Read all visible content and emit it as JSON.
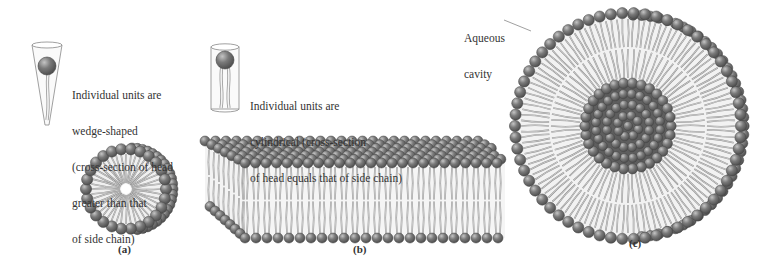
{
  "figure": {
    "panels": [
      {
        "id": "a",
        "label": "(a)",
        "structure": "micelle",
        "unit_shape": "wedge",
        "caption_lines": [
          "Individual units are",
          "wedge-shaped",
          "(cross-section of head",
          "greater than that",
          "of side chain)"
        ]
      },
      {
        "id": "b",
        "label": "(b)",
        "structure": "bilayer",
        "unit_shape": "cylinder",
        "caption_lines": [
          "Individual units are",
          "cylindrical (cross-section",
          "of head equals that of side chain)"
        ]
      },
      {
        "id": "c",
        "label": "(c)",
        "structure": "liposome",
        "callout_lines": [
          "Aqueous",
          "cavity"
        ]
      }
    ],
    "colors": {
      "head_fill": "#6e6e6e",
      "head_highlight": "#b5b5b5",
      "head_stroke": "#444444",
      "tail_stroke": "#8a8a8a",
      "tail_fill": "#f2f2f2",
      "text": "#333333",
      "background": "#ffffff"
    }
  }
}
